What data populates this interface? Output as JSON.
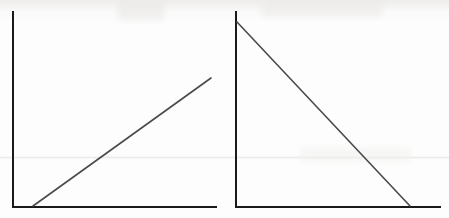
{
  "figure": {
    "width": 449,
    "height": 218,
    "background_color": "#fdfdfd",
    "axis_color": "#1a1a1a",
    "line_color": "#4a4a4a",
    "axis_width": 2,
    "line_width": 1.6,
    "panel_count": 2
  },
  "chart_data": [
    {
      "type": "line",
      "title": "",
      "subtitle": "",
      "xlabel": "",
      "ylabel": "",
      "legend": [],
      "grid": false,
      "legend_position": "none",
      "xticks": [],
      "yticks": [],
      "xlim": [
        0,
        100
      ],
      "ylim": [
        0,
        100
      ],
      "panel": "left",
      "description": "Upward sloping straight line rising from the x-axis",
      "series": [
        {
          "name": "increasing-line",
          "x": [
            10,
            100
          ],
          "y": [
            0,
            66
          ],
          "color": "#4a4a4a"
        }
      ],
      "axes_pixels": {
        "origin_x": 13,
        "origin_y": 207,
        "y_axis_top": 12,
        "x_axis_right": 216
      },
      "line_pixels": {
        "x1": 33,
        "y1": 206,
        "x2": 211,
        "y2": 78
      }
    },
    {
      "type": "line",
      "title": "",
      "subtitle": "",
      "xlabel": "",
      "ylabel": "",
      "legend": [],
      "grid": false,
      "legend_position": "none",
      "xticks": [],
      "yticks": [],
      "xlim": [
        0,
        100
      ],
      "ylim": [
        0,
        100
      ],
      "panel": "right",
      "description": "Downward sloping straight line falling from the y-axis to the x-axis",
      "series": [
        {
          "name": "decreasing-line",
          "x": [
            0,
            85
          ],
          "y": [
            95,
            0
          ],
          "color": "#4a4a4a"
        }
      ],
      "axes_pixels": {
        "origin_x": 236,
        "origin_y": 207,
        "y_axis_top": 12,
        "x_axis_right": 440
      },
      "line_pixels": {
        "x1": 237,
        "y1": 22,
        "x2": 410,
        "y2": 206
      }
    }
  ]
}
